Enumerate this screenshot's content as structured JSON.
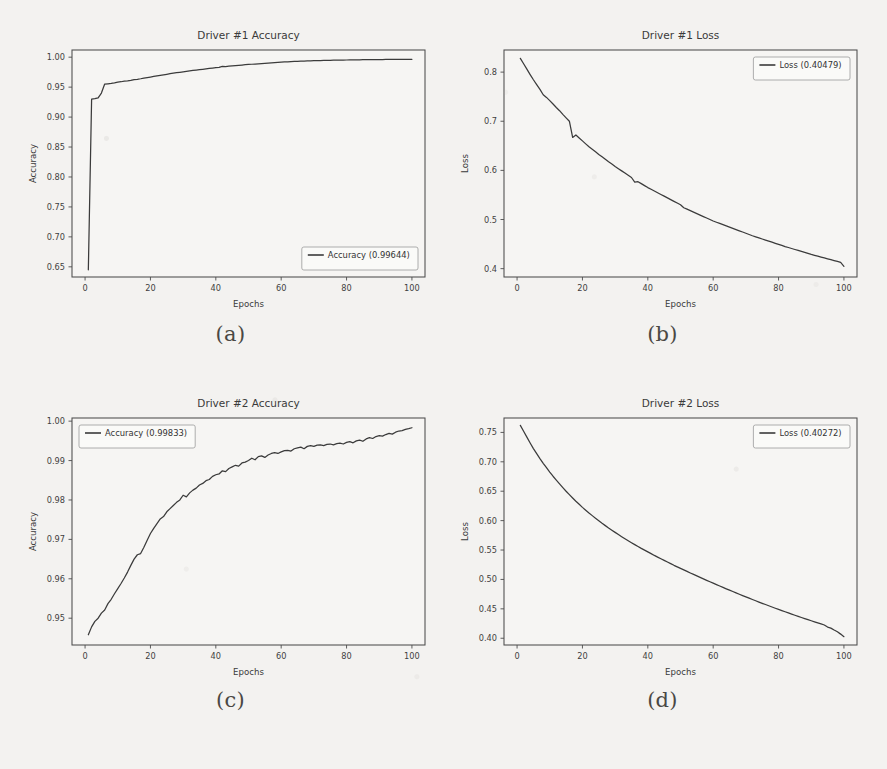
{
  "figure": {
    "background_color": "#f3f2f0",
    "line_color": "#3b3b3b",
    "captions": [
      {
        "id": "caption-a",
        "text": "(a)"
      },
      {
        "id": "caption-b",
        "text": "(b)"
      },
      {
        "id": "caption-c",
        "text": "(c)"
      },
      {
        "id": "caption-d",
        "text": "(d)"
      }
    ]
  },
  "chart_data": [
    {
      "panel": "a",
      "type": "line",
      "title": "Driver #1 Accuracy",
      "xlabel": "Epochs",
      "ylabel": "Accuracy",
      "xlim": [
        -4,
        104
      ],
      "ylim": [
        0.633,
        1.012
      ],
      "xticks": [
        0,
        20,
        40,
        60,
        80,
        100
      ],
      "xticklabels": [
        "0",
        "20",
        "40",
        "60",
        "80",
        "100"
      ],
      "yticks": [
        0.65,
        0.7,
        0.75,
        0.8,
        0.85,
        0.9,
        0.95,
        1.0
      ],
      "yticklabels": [
        "0.65",
        "0.70",
        "0.75",
        "0.80",
        "0.85",
        "0.90",
        "0.95",
        "1.00"
      ],
      "grid": false,
      "legend_position": "lower right",
      "legend": [
        {
          "label": "Accuracy (0.99644)",
          "color": "#3b3b3b"
        }
      ],
      "series": [
        {
          "name": "Accuracy",
          "final_value": 0.99644,
          "x": [
            1,
            2,
            3,
            4,
            5,
            6,
            7,
            8,
            9,
            10,
            11,
            12,
            13,
            14,
            15,
            16,
            17,
            18,
            19,
            20,
            21,
            22,
            23,
            24,
            25,
            26,
            27,
            28,
            29,
            30,
            31,
            32,
            33,
            34,
            35,
            36,
            37,
            38,
            39,
            40,
            41,
            42,
            43,
            44,
            45,
            46,
            47,
            48,
            49,
            50,
            51,
            52,
            53,
            54,
            55,
            56,
            57,
            58,
            59,
            60,
            61,
            62,
            63,
            64,
            65,
            66,
            67,
            68,
            69,
            70,
            71,
            72,
            73,
            74,
            75,
            76,
            77,
            78,
            79,
            80,
            81,
            82,
            83,
            84,
            85,
            86,
            87,
            88,
            89,
            90,
            91,
            92,
            93,
            94,
            95,
            96,
            97,
            98,
            99,
            100
          ],
          "y": [
            0.645,
            0.9301,
            0.9308,
            0.932,
            0.9401,
            0.9551,
            0.9556,
            0.9562,
            0.957,
            0.9582,
            0.959,
            0.9601,
            0.9605,
            0.9614,
            0.9625,
            0.9631,
            0.964,
            0.9652,
            0.966,
            0.9669,
            0.9678,
            0.9688,
            0.9697,
            0.9706,
            0.9715,
            0.9724,
            0.9733,
            0.9741,
            0.9748,
            0.9756,
            0.9763,
            0.977,
            0.9778,
            0.9785,
            0.9792,
            0.9798,
            0.9805,
            0.9812,
            0.9818,
            0.9824,
            0.9831,
            0.9845,
            0.9843,
            0.9849,
            0.9855,
            0.986,
            0.9865,
            0.9869,
            0.9874,
            0.9878,
            0.9882,
            0.9886,
            0.989,
            0.9894,
            0.9898,
            0.9902,
            0.9906,
            0.9909,
            0.9912,
            0.9916,
            0.992,
            0.9923,
            0.9926,
            0.9929,
            0.9932,
            0.9934,
            0.9936,
            0.9938,
            0.994,
            0.9941,
            0.9942,
            0.9944,
            0.9945,
            0.9946,
            0.9947,
            0.9949,
            0.995,
            0.9951,
            0.9952,
            0.9953,
            0.9954,
            0.9955,
            0.9956,
            0.9957,
            0.9958,
            0.9958,
            0.9959,
            0.996,
            0.996,
            0.9961,
            0.9961,
            0.9962,
            0.9962,
            0.9963,
            0.9963,
            0.9963,
            0.9964,
            0.9964,
            0.9964,
            0.99644
          ]
        }
      ]
    },
    {
      "panel": "b",
      "type": "line",
      "title": "Driver #1 Loss",
      "xlabel": "Epochs",
      "ylabel": "Loss",
      "xlim": [
        -4,
        104
      ],
      "ylim": [
        0.383,
        0.845
      ],
      "xticks": [
        0,
        20,
        40,
        60,
        80,
        100
      ],
      "xticklabels": [
        "0",
        "20",
        "40",
        "60",
        "80",
        "100"
      ],
      "yticks": [
        0.4,
        0.5,
        0.6,
        0.7,
        0.8
      ],
      "yticklabels": [
        "0.4",
        "0.5",
        "0.6",
        "0.7",
        "0.8"
      ],
      "grid": false,
      "legend_position": "upper right",
      "legend": [
        {
          "label": "Loss (0.40479)",
          "color": "#3b3b3b"
        }
      ],
      "series": [
        {
          "name": "Loss",
          "final_value": 0.40479,
          "x": [
            1,
            2,
            3,
            4,
            5,
            6,
            7,
            8,
            9,
            10,
            11,
            12,
            13,
            14,
            15,
            16,
            17,
            18,
            19,
            20,
            21,
            22,
            23,
            24,
            25,
            26,
            27,
            28,
            29,
            30,
            31,
            32,
            33,
            34,
            35,
            36,
            37,
            38,
            39,
            40,
            41,
            42,
            43,
            44,
            45,
            46,
            47,
            48,
            49,
            50,
            51,
            52,
            53,
            54,
            55,
            56,
            57,
            58,
            59,
            60,
            61,
            62,
            63,
            64,
            65,
            66,
            67,
            68,
            69,
            70,
            71,
            72,
            73,
            74,
            75,
            76,
            77,
            78,
            79,
            80,
            81,
            82,
            83,
            84,
            85,
            86,
            87,
            88,
            89,
            90,
            91,
            92,
            93,
            94,
            95,
            96,
            97,
            98,
            99,
            100
          ],
          "y": [
            0.828,
            0.817,
            0.806,
            0.795,
            0.7845,
            0.7745,
            0.765,
            0.754,
            0.7485,
            0.742,
            0.735,
            0.728,
            0.7215,
            0.714,
            0.707,
            0.7,
            0.667,
            0.672,
            0.666,
            0.66,
            0.654,
            0.648,
            0.643,
            0.638,
            0.6325,
            0.6275,
            0.6225,
            0.6175,
            0.613,
            0.608,
            0.6035,
            0.599,
            0.5945,
            0.59,
            0.5855,
            0.576,
            0.577,
            0.573,
            0.569,
            0.565,
            0.5615,
            0.558,
            0.5545,
            0.551,
            0.5475,
            0.544,
            0.5405,
            0.537,
            0.5335,
            0.53,
            0.524,
            0.521,
            0.518,
            0.515,
            0.512,
            0.509,
            0.506,
            0.503,
            0.5,
            0.497,
            0.4945,
            0.492,
            0.4895,
            0.487,
            0.4845,
            0.482,
            0.4795,
            0.477,
            0.4745,
            0.472,
            0.4695,
            0.467,
            0.4648,
            0.4626,
            0.4604,
            0.4582,
            0.456,
            0.4538,
            0.4516,
            0.4494,
            0.4472,
            0.445,
            0.443,
            0.441,
            0.439,
            0.437,
            0.435,
            0.433,
            0.431,
            0.429,
            0.4272,
            0.4254,
            0.4236,
            0.4218,
            0.42,
            0.4182,
            0.4164,
            0.4146,
            0.4128,
            0.40479
          ]
        }
      ]
    },
    {
      "panel": "c",
      "type": "line",
      "title": "Driver #2 Accuracy",
      "xlabel": "Epochs",
      "ylabel": "Accuracy",
      "xlim": [
        -4,
        104
      ],
      "ylim": [
        0.9432,
        1.0008
      ],
      "xticks": [
        0,
        20,
        40,
        60,
        80,
        100
      ],
      "xticklabels": [
        "0",
        "20",
        "40",
        "60",
        "80",
        "100"
      ],
      "yticks": [
        0.95,
        0.96,
        0.97,
        0.98,
        0.99,
        1.0
      ],
      "yticklabels": [
        "0.95",
        "0.96",
        "0.97",
        "0.98",
        "0.99",
        "1.00"
      ],
      "grid": false,
      "legend_position": "upper left",
      "legend": [
        {
          "label": "Accuracy (0.99833)",
          "color": "#3b3b3b"
        }
      ],
      "series": [
        {
          "name": "Accuracy",
          "final_value": 0.99833,
          "x": [
            1,
            2,
            3,
            4,
            5,
            6,
            7,
            8,
            9,
            10,
            11,
            12,
            13,
            14,
            15,
            16,
            17,
            18,
            19,
            20,
            21,
            22,
            23,
            24,
            25,
            26,
            27,
            28,
            29,
            30,
            31,
            32,
            33,
            34,
            35,
            36,
            37,
            38,
            39,
            40,
            41,
            42,
            43,
            44,
            45,
            46,
            47,
            48,
            49,
            50,
            51,
            52,
            53,
            54,
            55,
            56,
            57,
            58,
            59,
            60,
            61,
            62,
            63,
            64,
            65,
            66,
            67,
            68,
            69,
            70,
            71,
            72,
            73,
            74,
            75,
            76,
            77,
            78,
            79,
            80,
            81,
            82,
            83,
            84,
            85,
            86,
            87,
            88,
            89,
            90,
            91,
            92,
            93,
            94,
            95,
            96,
            97,
            98,
            99,
            100
          ],
          "y": [
            0.9458,
            0.9478,
            0.9492,
            0.95,
            0.9513,
            0.9521,
            0.9537,
            0.9548,
            0.9562,
            0.9575,
            0.9588,
            0.9602,
            0.9617,
            0.9634,
            0.965,
            0.9661,
            0.9664,
            0.968,
            0.9698,
            0.9715,
            0.9728,
            0.974,
            0.9752,
            0.9758,
            0.977,
            0.9778,
            0.9786,
            0.9794,
            0.98,
            0.9812,
            0.9808,
            0.9818,
            0.9825,
            0.983,
            0.9838,
            0.9842,
            0.9849,
            0.9852,
            0.986,
            0.9864,
            0.9866,
            0.9874,
            0.9872,
            0.988,
            0.9884,
            0.9888,
            0.9886,
            0.9894,
            0.9896,
            0.99,
            0.9906,
            0.9902,
            0.991,
            0.9912,
            0.9908,
            0.9914,
            0.9918,
            0.992,
            0.9918,
            0.9922,
            0.9925,
            0.9926,
            0.9924,
            0.993,
            0.9932,
            0.9934,
            0.993,
            0.9936,
            0.9938,
            0.9936,
            0.9939,
            0.994,
            0.9938,
            0.9941,
            0.9942,
            0.994,
            0.9943,
            0.9944,
            0.9942,
            0.9946,
            0.9948,
            0.9945,
            0.995,
            0.9952,
            0.9949,
            0.9955,
            0.9958,
            0.9956,
            0.9961,
            0.9963,
            0.9962,
            0.9966,
            0.9969,
            0.9967,
            0.9972,
            0.9975,
            0.9976,
            0.9979,
            0.9981,
            0.99833
          ]
        }
      ]
    },
    {
      "panel": "d",
      "type": "line",
      "title": "Driver #2 Loss",
      "xlabel": "Epochs",
      "ylabel": "Loss",
      "xlim": [
        -4,
        104
      ],
      "ylim": [
        0.3885,
        0.7745
      ],
      "xticks": [
        0,
        20,
        40,
        60,
        80,
        100
      ],
      "xticklabels": [
        "0",
        "20",
        "40",
        "60",
        "80",
        "100"
      ],
      "yticks": [
        0.4,
        0.45,
        0.5,
        0.55,
        0.6,
        0.65,
        0.7,
        0.75
      ],
      "yticklabels": [
        "0.40",
        "0.45",
        "0.50",
        "0.55",
        "0.60",
        "0.65",
        "0.70",
        "0.75"
      ],
      "grid": false,
      "legend_position": "upper right",
      "legend": [
        {
          "label": "Loss (0.40272)",
          "color": "#3b3b3b"
        }
      ],
      "series": [
        {
          "name": "Loss",
          "final_value": 0.40272,
          "x": [
            1,
            2,
            3,
            4,
            5,
            6,
            7,
            8,
            9,
            10,
            11,
            12,
            13,
            14,
            15,
            16,
            17,
            18,
            19,
            20,
            21,
            22,
            23,
            24,
            25,
            26,
            27,
            28,
            29,
            30,
            31,
            32,
            33,
            34,
            35,
            36,
            37,
            38,
            39,
            40,
            41,
            42,
            43,
            44,
            45,
            46,
            47,
            48,
            49,
            50,
            51,
            52,
            53,
            54,
            55,
            56,
            57,
            58,
            59,
            60,
            61,
            62,
            63,
            64,
            65,
            66,
            67,
            68,
            69,
            70,
            71,
            72,
            73,
            74,
            75,
            76,
            77,
            78,
            79,
            80,
            81,
            82,
            83,
            84,
            85,
            86,
            87,
            88,
            89,
            90,
            91,
            92,
            93,
            94,
            95,
            96,
            97,
            98,
            99,
            100
          ],
          "y": [
            0.762,
            0.752,
            0.742,
            0.732,
            0.7225,
            0.714,
            0.7055,
            0.6975,
            0.69,
            0.6825,
            0.6755,
            0.669,
            0.6625,
            0.6562,
            0.65,
            0.6442,
            0.6385,
            0.633,
            0.6278,
            0.6225,
            0.6178,
            0.613,
            0.6085,
            0.604,
            0.5998,
            0.5955,
            0.5915,
            0.5875,
            0.5838,
            0.58,
            0.5763,
            0.5727,
            0.5692,
            0.5658,
            0.5625,
            0.5592,
            0.556,
            0.5528,
            0.5498,
            0.5468,
            0.5438,
            0.5408,
            0.538,
            0.5352,
            0.5324,
            0.5296,
            0.5268,
            0.524,
            0.5214,
            0.5188,
            0.5162,
            0.5136,
            0.511,
            0.5085,
            0.506,
            0.5035,
            0.501,
            0.4985,
            0.496,
            0.4936,
            0.4912,
            0.4888,
            0.4864,
            0.484,
            0.4817,
            0.4794,
            0.4771,
            0.4748,
            0.4725,
            0.4703,
            0.4681,
            0.4659,
            0.4637,
            0.4615,
            0.4594,
            0.4573,
            0.4552,
            0.4531,
            0.451,
            0.449,
            0.447,
            0.445,
            0.443,
            0.441,
            0.4391,
            0.4372,
            0.4353,
            0.4334,
            0.4315,
            0.4297,
            0.4279,
            0.4261,
            0.4243,
            0.4225,
            0.419,
            0.4172,
            0.414,
            0.411,
            0.407,
            0.40272
          ]
        }
      ]
    }
  ]
}
